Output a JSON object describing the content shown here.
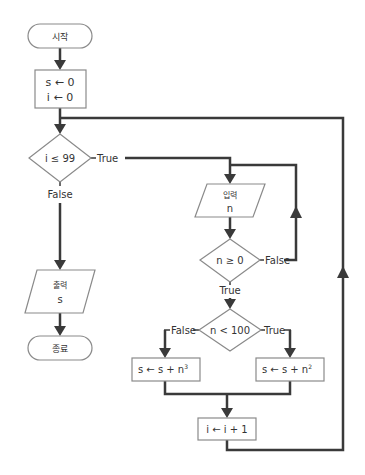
{
  "colors": {
    "line": "#3a3a3a",
    "shape_stroke": "#888888",
    "shape_fill": "#ffffff",
    "text": "#333333"
  },
  "nodes": {
    "start": {
      "label": "시작",
      "type": "terminal"
    },
    "init": {
      "line1": "s ← 0",
      "line2": "i ← 0",
      "type": "process"
    },
    "cond_i": {
      "label": "i ≤ 99",
      "type": "decision"
    },
    "input_n": {
      "line1": "입력",
      "line2": "n",
      "type": "io"
    },
    "cond_n_nonneg": {
      "label": "n ≥ 0",
      "type": "decision"
    },
    "cond_n_small": {
      "label": "n < 100",
      "type": "decision"
    },
    "add_cube": {
      "label": "s ← s + n",
      "exponent": "3",
      "type": "process"
    },
    "add_square": {
      "label": "s ← s + n",
      "exponent": "2",
      "type": "process"
    },
    "increment": {
      "label": "i ← i + 1",
      "type": "process"
    },
    "output_s": {
      "line1": "출력",
      "line2": "s",
      "type": "io"
    },
    "end": {
      "label": "종료",
      "type": "terminal"
    }
  },
  "edge_labels": {
    "cond_i_true": "True",
    "cond_i_false": "False",
    "cond_n_nonneg_true": "True",
    "cond_n_nonneg_false": "False",
    "cond_n_small_true": "True",
    "cond_n_small_false": "False"
  }
}
